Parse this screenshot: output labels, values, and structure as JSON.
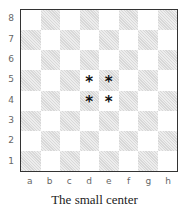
{
  "diagram": {
    "type": "chessboard",
    "caption": "The small center",
    "files": [
      "a",
      "b",
      "c",
      "d",
      "e",
      "f",
      "g",
      "h"
    ],
    "ranks": [
      "8",
      "7",
      "6",
      "5",
      "4",
      "3",
      "2",
      "1"
    ],
    "marks": [
      {
        "square": "d5",
        "symbol": "*"
      },
      {
        "square": "e5",
        "symbol": "*"
      },
      {
        "square": "d4",
        "symbol": "*"
      },
      {
        "square": "e4",
        "symbol": "*"
      }
    ],
    "colors": {
      "dark_square": "#d8d8d8",
      "light_square": "#ffffff",
      "border": "#333333"
    }
  }
}
